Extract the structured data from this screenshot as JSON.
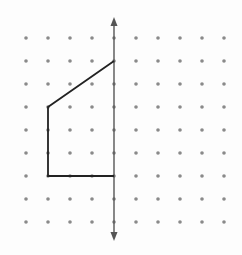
{
  "diagram": {
    "type": "dot-grid-reflection",
    "grid": {
      "columns": 10,
      "rows": 9,
      "x_start": 26,
      "y_start": 38,
      "x_spacing": 22,
      "y_spacing": 23,
      "dot_radius": 1.8,
      "dot_color": "#8a8a8a"
    },
    "line_of_reflection": {
      "orientation": "vertical",
      "column_index": 4,
      "y_top": 17,
      "y_bottom": 241,
      "color": "#555555",
      "arrows": "both"
    },
    "figure": {
      "description": "open polyline to be reflected across the vertical line",
      "grid_points": [
        [
          4,
          1
        ],
        [
          1,
          3
        ],
        [
          1,
          6
        ],
        [
          4,
          6
        ]
      ],
      "color": "#222222"
    }
  }
}
